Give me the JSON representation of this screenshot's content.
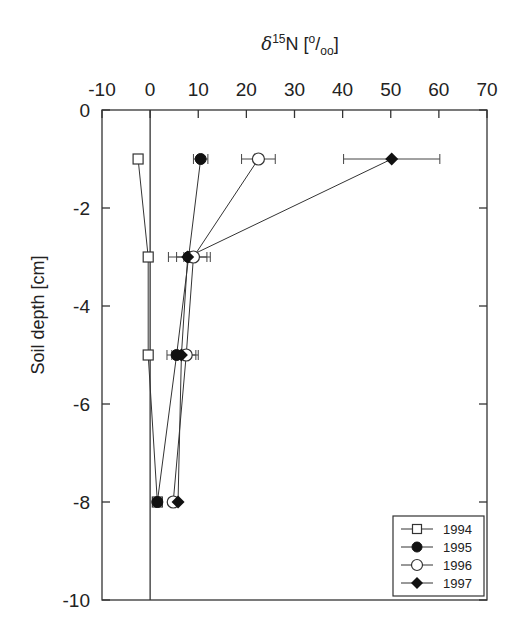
{
  "chart_data": {
    "type": "line",
    "title": "",
    "xlabel": "δ15N [‰]",
    "xlabel_parts": {
      "delta": "δ",
      "sup": "15",
      "main": "N [",
      "sup2": "o",
      "slash": "/",
      "sub": "oo",
      "close": "]"
    },
    "ylabel": "Soil depth [cm]",
    "xlim": [
      -10,
      70
    ],
    "ylim": [
      -10,
      0
    ],
    "x_ticks": [
      -10,
      0,
      10,
      20,
      30,
      40,
      50,
      60,
      70
    ],
    "y_ticks": [
      0,
      -2,
      -4,
      -6,
      -8,
      -10
    ],
    "x_axis_position": "top",
    "grid": false,
    "zero_reference_line": 0,
    "legend_position": "lower right",
    "depths": [
      -1,
      -3,
      -5,
      -8
    ],
    "series": [
      {
        "name": "1994",
        "marker": "open-square",
        "x": [
          -2.5,
          -0.4,
          -0.4,
          1.5
        ],
        "xerr": [
          0,
          0,
          0,
          0
        ]
      },
      {
        "name": "1995",
        "marker": "filled-circle",
        "x": [
          10.5,
          8.0,
          5.5,
          1.5
        ],
        "xerr": [
          1.5,
          1.0,
          1.0,
          0
        ]
      },
      {
        "name": "1996",
        "marker": "open-circle",
        "x": [
          22.5,
          9.0,
          7.5,
          4.8
        ],
        "xerr": [
          3.5,
          3.5,
          2.5,
          0
        ]
      },
      {
        "name": "1997",
        "marker": "filled-diamond",
        "x": [
          50.2,
          7.8,
          6.5,
          5.8
        ],
        "xerr": [
          10.0,
          4.0,
          3.0,
          0
        ]
      }
    ]
  }
}
